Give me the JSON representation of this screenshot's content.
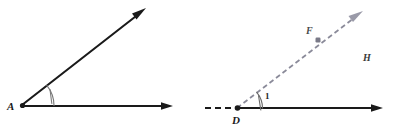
{
  "figure": {
    "background_color": "#ffffff",
    "width": 395,
    "height": 133,
    "colors": {
      "solid_stroke": "#1a1a1a",
      "dashed_stroke": "#8a8a99",
      "dashed_black_stroke": "#1a1a1a",
      "arc_stroke": "#6a6a6a",
      "label_text": "#1a1a1a",
      "point_marker": "#6a6a78"
    }
  },
  "diagrams": [
    {
      "id": "angle-a",
      "name": "angle-a-diagram",
      "vertex": {
        "label": "A",
        "x": 22,
        "y": 105,
        "label_x": 7,
        "label_y": 110
      },
      "rays": [
        {
          "name": "ray-a-upper",
          "style": "solid",
          "color": "#1a1a1a",
          "from_x": 22,
          "from_y": 105,
          "to_x": 145,
          "to_y": 9,
          "arrow": true
        },
        {
          "name": "ray-a-horizontal",
          "style": "solid",
          "color": "#1a1a1a",
          "from_x": 22,
          "from_y": 106,
          "to_x": 172,
          "to_y": 106,
          "arrow": true
        }
      ],
      "angle_arc": {
        "name": "angle-arc-a",
        "center_x": 22,
        "center_y": 105,
        "radius": 32,
        "tick_marks": 1,
        "label": ""
      }
    },
    {
      "id": "angle-d",
      "name": "angle-d-diagram",
      "vertex": {
        "label": "D",
        "x": 237,
        "y": 108,
        "label_x": 232,
        "label_y": 124
      },
      "rays": [
        {
          "name": "ray-d-upper-dashed",
          "style": "dashed",
          "color": "#8a8a99",
          "from_x": 237,
          "from_y": 108,
          "to_x": 362,
          "to_y": 12,
          "arrow": true
        },
        {
          "name": "ray-d-horizontal",
          "style": "solid",
          "color": "#1a1a1a",
          "from_x": 237,
          "from_y": 108,
          "to_x": 382,
          "to_y": 108,
          "arrow": true
        },
        {
          "name": "segment-d-left-dashed",
          "style": "dashed",
          "color": "#1a1a1a",
          "from_x": 205,
          "from_y": 108,
          "to_x": 237,
          "to_y": 108,
          "arrow": false
        }
      ],
      "angle_arc": {
        "name": "angle-arc-d",
        "center_x": 237,
        "center_y": 108,
        "radius": 25,
        "tick_marks": 1,
        "label": "1",
        "label_x": 265,
        "label_y": 99
      },
      "points": [
        {
          "name": "point-f",
          "label": "F",
          "marker_x": 318,
          "marker_y": 40,
          "label_x": 306,
          "label_y": 34
        }
      ],
      "regions": [
        {
          "name": "region-h",
          "label": "H",
          "label_x": 363,
          "label_y": 61
        }
      ]
    }
  ]
}
